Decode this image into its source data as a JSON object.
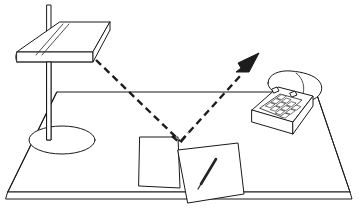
{
  "illustration": {
    "title": "Desk lamp light reflecting off paper on a desk",
    "style": "black and white line drawing",
    "background_color": "#ffffff",
    "line_color": "#1a1a1a",
    "ray_color": "#1c1c1c"
  },
  "objects": {
    "desk": {
      "name": "desk",
      "surface_label": "desk top surface",
      "edge_label": "desk front edge"
    },
    "lamp": {
      "name": "desk lamp",
      "shade_label": "flat rectangular lamp shade",
      "pole_label": "lamp vertical pole",
      "base_label": "lamp round base"
    },
    "telephone": {
      "name": "push button telephone",
      "handset_label": "telephone handset",
      "keypad_label": "telephone keypad",
      "keypad_rows": 4,
      "keypad_cols": 3
    },
    "paper_left": {
      "name": "sheet of paper",
      "label": "plain paper sheet"
    },
    "paper_right": {
      "name": "sheet of paper with pen",
      "label": "paper sheet with pen"
    },
    "pen": {
      "name": "pen",
      "label": "pen resting on paper"
    }
  },
  "light_ray": {
    "incident_label": "incident light ray from lamp",
    "reflected_label": "reflected light ray toward viewer",
    "arrow_label": "reflected ray direction arrow",
    "reflection_point_label": "reflection point on paper",
    "line_style": "dashed"
  }
}
